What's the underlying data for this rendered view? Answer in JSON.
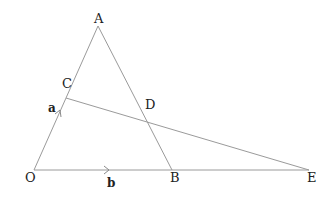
{
  "diagram": {
    "type": "geometry-vector-diagram",
    "colors": {
      "line": "#9a9a9a",
      "text": "#222222",
      "background": "#ffffff"
    },
    "points": {
      "O": {
        "label": "O",
        "x": 34,
        "y": 170
      },
      "A": {
        "label": "A",
        "x": 98,
        "y": 26
      },
      "B": {
        "label": "B",
        "x": 172,
        "y": 170
      },
      "E": {
        "label": "E",
        "x": 309,
        "y": 170
      },
      "C": {
        "label": "C",
        "x": 66,
        "y": 98
      },
      "D": {
        "label": "D",
        "x": 149,
        "y": 123
      }
    },
    "segments": [
      {
        "from": "O",
        "to": "A"
      },
      {
        "from": "A",
        "to": "B"
      },
      {
        "from": "O",
        "to": "E"
      },
      {
        "from": "C",
        "to": "E"
      }
    ],
    "vectors": {
      "a": {
        "label": "a",
        "along": "OA"
      },
      "b": {
        "label": "b",
        "along": "OB"
      }
    }
  }
}
